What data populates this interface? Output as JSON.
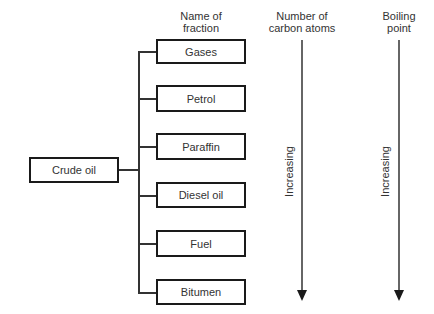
{
  "diagram": {
    "source": {
      "label": "Crude oil"
    },
    "columns": {
      "fraction_header": "Name of\nfraction",
      "fraction_header_lines": [
        "Name of",
        "fraction"
      ],
      "carbon_header_lines": [
        "Number of",
        "carbon atoms"
      ],
      "boiling_header_lines": [
        "Boiling",
        "point"
      ]
    },
    "fractions": [
      {
        "label": "Gases"
      },
      {
        "label": "Petrol"
      },
      {
        "label": "Paraffin"
      },
      {
        "label": "Diesel oil"
      },
      {
        "label": "Fuel"
      },
      {
        "label": "Bitumen"
      }
    ],
    "arrows": [
      {
        "name": "carbon-atoms-arrow",
        "label": "Increasing",
        "direction": "down"
      },
      {
        "name": "boiling-point-arrow",
        "label": "Increasing",
        "direction": "down"
      }
    ],
    "colors": {
      "stroke": "#1a1a1a",
      "text": "#333333",
      "background": "#ffffff"
    }
  }
}
